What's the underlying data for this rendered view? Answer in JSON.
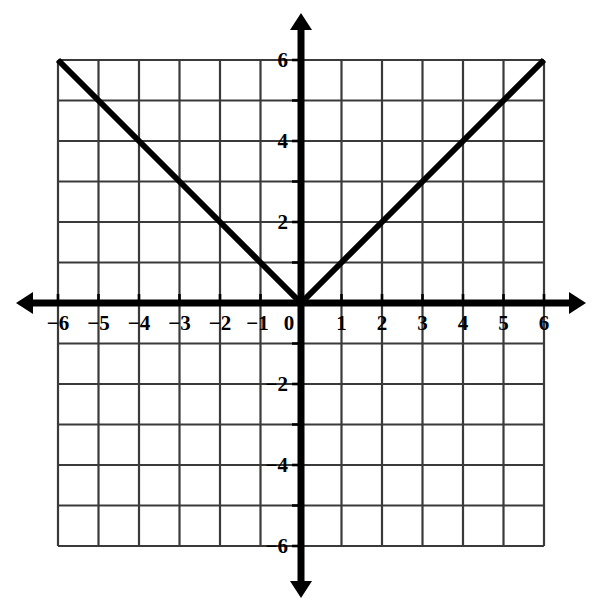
{
  "chart_data": {
    "type": "line",
    "title": "",
    "subtitle": "",
    "xlabel": "",
    "ylabel": "",
    "xlim": [
      -6,
      6
    ],
    "ylim": [
      -6,
      6
    ],
    "grid": true,
    "grid_step": 1,
    "legend": "none",
    "axis_style": "double-arrow-cartesian",
    "x_tick_labels": [
      "-6",
      "-5",
      "-4",
      "-3",
      "-2",
      "-1",
      "0",
      "1",
      "2",
      "3",
      "4",
      "5",
      "6"
    ],
    "x_tick_values": [
      -6,
      -5,
      -4,
      -3,
      -2,
      -1,
      0,
      1,
      2,
      3,
      4,
      5,
      6
    ],
    "y_tick_labels": [
      "6",
      "4",
      "2",
      "-2",
      "-4",
      "-6"
    ],
    "y_tick_values": [
      6,
      4,
      2,
      -2,
      -4,
      -6
    ],
    "series": [
      {
        "name": "y = |x|",
        "equation": "y = |x|",
        "style": "solid",
        "color": "#000000",
        "line_width": 6,
        "points": [
          {
            "x": -6,
            "y": 6
          },
          {
            "x": -5,
            "y": 5
          },
          {
            "x": -4,
            "y": 4
          },
          {
            "x": -3,
            "y": 3
          },
          {
            "x": -2,
            "y": 2
          },
          {
            "x": -1,
            "y": 1
          },
          {
            "x": 0,
            "y": 0
          },
          {
            "x": 1,
            "y": 1
          },
          {
            "x": 2,
            "y": 2
          },
          {
            "x": 3,
            "y": 3
          },
          {
            "x": 4,
            "y": 4
          },
          {
            "x": 5,
            "y": 5
          },
          {
            "x": 6,
            "y": 6
          }
        ]
      }
    ],
    "annotations": []
  },
  "colors": {
    "background": "#ffffff",
    "axis": "#000000",
    "grid": "#3a3a3a",
    "curve": "#000000",
    "label": "#000000"
  },
  "geometry": {
    "origin_x": 301,
    "origin_y": 303,
    "cell": 40.5,
    "grid_left": 58.5,
    "grid_right": 544,
    "grid_top": 60,
    "grid_bottom": 547,
    "x_axis_left_tip": 16,
    "x_axis_right_tip": 586,
    "y_axis_top_tip": 13,
    "y_axis_bottom_tip": 598
  }
}
